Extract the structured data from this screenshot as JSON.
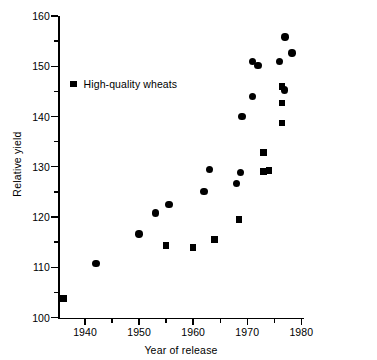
{
  "chart_data": {
    "type": "scatter",
    "title": "",
    "xlabel": "Year of release",
    "ylabel": "Relative yield",
    "xlim": [
      1935,
      1980.5
    ],
    "ylim": [
      100,
      160
    ],
    "grid": false,
    "legend_position": "upper-left",
    "x_ticks_major": [
      1940,
      1950,
      1960,
      1970,
      1980
    ],
    "x_tick_labels": [
      "1940",
      "1950",
      "1960",
      "1970",
      "1980"
    ],
    "x_ticks_minor": [
      1945,
      1955,
      1965,
      1975
    ],
    "y_ticks_major": [
      100,
      110,
      120,
      130,
      140,
      150,
      160
    ],
    "y_tick_labels": [
      "100",
      "110",
      "120",
      "130",
      "140",
      "150",
      "160"
    ],
    "y_ticks_minor": [
      105,
      115,
      125,
      135,
      145,
      155
    ],
    "series": [
      {
        "name": "Other wheats",
        "marker": "circle",
        "color": "#000000",
        "points": [
          [
            1942.0,
            110.8
          ],
          [
            1950.0,
            116.6
          ],
          [
            1953.0,
            120.8
          ],
          [
            1955.5,
            122.5
          ],
          [
            1962.0,
            125.1
          ],
          [
            1963.0,
            129.5
          ],
          [
            1968.0,
            126.7
          ],
          [
            1968.7,
            128.9
          ],
          [
            1969.0,
            140.0
          ],
          [
            1971.0,
            144.0
          ],
          [
            1971.0,
            151.0
          ],
          [
            1972.0,
            150.2
          ],
          [
            1976.0,
            150.9
          ],
          [
            1976.9,
            145.3
          ],
          [
            1977.0,
            155.8
          ],
          [
            1978.3,
            152.6
          ]
        ]
      },
      {
        "name": "High-quality wheats",
        "marker": "square",
        "color": "#000000",
        "points": [
          [
            1936.0,
            103.8
          ],
          [
            1955.0,
            114.3
          ],
          [
            1960.0,
            113.9
          ],
          [
            1964.0,
            115.5
          ],
          [
            1968.5,
            119.5
          ],
          [
            1973.0,
            132.8
          ],
          [
            1973.0,
            129.1
          ],
          [
            1974.0,
            129.2
          ],
          [
            1976.4,
            146.0
          ],
          [
            1976.4,
            142.7
          ],
          [
            1976.4,
            138.7
          ]
        ]
      }
    ]
  },
  "legend": {
    "label": "High-quality wheats"
  }
}
